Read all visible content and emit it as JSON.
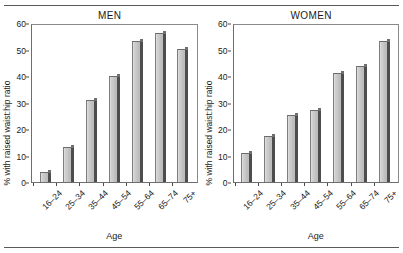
{
  "figure": {
    "top_rule": true,
    "bottom_rule": true
  },
  "chart_data": [
    {
      "type": "bar",
      "title": "MEN",
      "xlabel": "Age",
      "ylabel": "% with raised waist:hip ratio",
      "categories": [
        "16–24",
        "25–34",
        "35–44",
        "45–54",
        "55–64",
        "65–74",
        "75+"
      ],
      "values": [
        4,
        13.5,
        31.5,
        40.5,
        54,
        57,
        51
      ],
      "ylim": [
        0,
        60
      ],
      "yticks": [
        0,
        10,
        20,
        30,
        40,
        50,
        60
      ],
      "ytick_labels": [
        "0",
        "10",
        "20",
        "30",
        "40",
        "50",
        "60"
      ],
      "grid": false,
      "legend": false,
      "bar_face_color": "#c6c6c6",
      "bar_side_color": "#4d4d4d"
    },
    {
      "type": "bar",
      "title": "WOMEN",
      "xlabel": "Age",
      "ylabel": "% with raised waist:hip ratio",
      "categories": [
        "16–24",
        "25–34",
        "35–44",
        "45–54",
        "55–64",
        "65–74",
        "75+"
      ],
      "values": [
        11,
        17.5,
        25.5,
        27.5,
        41.5,
        44.5,
        54
      ],
      "ylim": [
        0,
        60
      ],
      "yticks": [
        0,
        10,
        20,
        30,
        40,
        50,
        60
      ],
      "ytick_labels": [
        "0",
        "10",
        "20",
        "30",
        "40",
        "50",
        "60"
      ],
      "grid": false,
      "legend": false,
      "bar_face_color": "#c6c6c6",
      "bar_side_color": "#4d4d4d"
    }
  ]
}
